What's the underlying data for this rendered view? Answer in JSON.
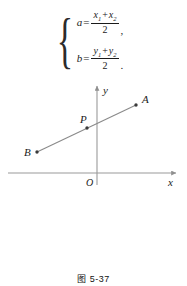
{
  "formula": {
    "brace": "{",
    "equations": [
      {
        "lhs": "a",
        "equals": "=",
        "numerator_first": "x",
        "numerator_first_sub": "1",
        "plus": "+",
        "numerator_second": "x",
        "numerator_second_sub": "2",
        "denominator": "2",
        "punctuation": ","
      },
      {
        "lhs": "b",
        "equals": "=",
        "numerator_first": "y",
        "numerator_first_sub": "1",
        "plus": "+",
        "numerator_second": "y",
        "numerator_second_sub": "2",
        "denominator": "2",
        "punctuation": "."
      }
    ]
  },
  "diagram": {
    "axis_x_label": "x",
    "axis_y_label": "y",
    "origin_label": "O",
    "points": [
      {
        "name": "A",
        "label": "A",
        "cx": 136,
        "cy": 23
      },
      {
        "name": "P",
        "label": "P",
        "cx": 87,
        "cy": 46
      },
      {
        "name": "B",
        "label": "B",
        "cx": 37,
        "cy": 70
      }
    ],
    "segment": {
      "x1": 37,
      "y1": 70,
      "x2": 136,
      "y2": 23
    },
    "axes": {
      "x_axis": {
        "x1": 8,
        "y1": 91,
        "x2": 178,
        "y2": 91
      },
      "y_axis": {
        "x1": 97,
        "y1": 103,
        "x2": 97,
        "y2": 2
      }
    },
    "colors": {
      "line": "#8a8a8a",
      "axis": "#9a9a9a",
      "point": "#3a3a3a"
    }
  },
  "caption": {
    "text": "图 5-37"
  }
}
